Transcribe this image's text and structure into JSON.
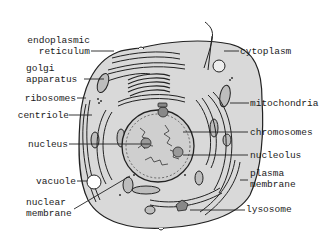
{
  "diagram": {
    "colors": {
      "cell_fill": "#d9d9d9",
      "stroke": "#222222",
      "background": "#ffffff",
      "organelle_fill": "#bdbdbd",
      "nucleus_fill": "#cfcfcf"
    },
    "labels_left": [
      {
        "id": "endoplasmic-reticulum",
        "line1": "endoplasmic",
        "line2": "reticulum"
      },
      {
        "id": "golgi-apparatus",
        "line1": "golgi",
        "line2": "apparatus"
      },
      {
        "id": "ribosomes",
        "line1": "ribosomes"
      },
      {
        "id": "centriole",
        "line1": "centriole"
      },
      {
        "id": "nucleus",
        "line1": "nucleus"
      },
      {
        "id": "vacuole",
        "line1": "vacuole"
      },
      {
        "id": "nuclear-membrane",
        "line1": "nuclear",
        "line2": "membrane"
      }
    ],
    "labels_right": [
      {
        "id": "cytoplasm",
        "line1": "cytoplasm"
      },
      {
        "id": "mitochondria",
        "line1": "mitochondria"
      },
      {
        "id": "chromosomes",
        "line1": "chromosomes"
      },
      {
        "id": "nucleolus",
        "line1": "nucleolus"
      },
      {
        "id": "plasma-membrane",
        "line1": "plasma",
        "line2": "membrane"
      },
      {
        "id": "lysosome",
        "line1": "lysosome"
      }
    ]
  }
}
